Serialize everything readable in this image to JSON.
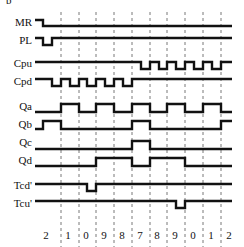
{
  "diagram": {
    "corner_mark": "b",
    "signals": [
      {
        "name": "MR",
        "label_y": 17
      },
      {
        "name": "PL",
        "label_y": 35
      },
      {
        "name": "Cpu",
        "label_y": 58
      },
      {
        "name": "Cpd",
        "label_y": 76
      },
      {
        "name": "Qa",
        "label_y": 101
      },
      {
        "name": "Qb",
        "label_y": 119
      },
      {
        "name": "Qc",
        "label_y": 137
      },
      {
        "name": "Qd",
        "label_y": 155
      },
      {
        "name": "Tcd'",
        "label_y": 180
      },
      {
        "name": "Tcu'",
        "label_y": 198
      }
    ],
    "count_sequence": [
      "2",
      "1",
      "0",
      "9",
      "8",
      "7",
      "8",
      "9",
      "0",
      "1",
      "2"
    ],
    "count_label_x": [
      46,
      68,
      86,
      104,
      122,
      140,
      157,
      175,
      193,
      211,
      229
    ],
    "gridlines_x": [
      61,
      79,
      96,
      114,
      132,
      150,
      167,
      185,
      203,
      221
    ],
    "waveform_color": "#111111",
    "gridline_color": "#555555"
  },
  "chart_data": {
    "type": "timing-diagram",
    "title": "",
    "x_tick_labels": [
      "2",
      "1",
      "0",
      "9",
      "8",
      "7",
      "8",
      "9",
      "0",
      "1",
      "2"
    ],
    "grid": true,
    "signals": {
      "MR": {
        "points": [
          [
            35,
            20
          ],
          [
            43,
            20
          ],
          [
            43,
            26
          ],
          [
            232,
            26
          ]
        ]
      },
      "PL": {
        "points": [
          [
            35,
            38
          ],
          [
            43,
            38
          ],
          [
            43,
            45
          ],
          [
            52,
            45
          ],
          [
            52,
            38
          ],
          [
            232,
            38
          ]
        ]
      },
      "Cpu": {
        "points": [
          [
            35,
            62
          ],
          [
            141,
            62
          ],
          [
            141,
            69
          ],
          [
            150,
            69
          ],
          [
            150,
            62
          ],
          [
            159,
            62
          ],
          [
            159,
            69
          ],
          [
            167,
            69
          ],
          [
            167,
            62
          ],
          [
            176,
            62
          ],
          [
            176,
            69
          ],
          [
            185,
            69
          ],
          [
            185,
            62
          ],
          [
            194,
            62
          ],
          [
            194,
            69
          ],
          [
            203,
            69
          ],
          [
            203,
            62
          ],
          [
            212,
            62
          ],
          [
            212,
            69
          ],
          [
            221,
            69
          ],
          [
            221,
            62
          ],
          [
            232,
            62
          ]
        ]
      },
      "Cpd": {
        "points": [
          [
            35,
            79
          ],
          [
            52,
            79
          ],
          [
            52,
            86
          ],
          [
            61,
            86
          ],
          [
            61,
            79
          ],
          [
            70,
            79
          ],
          [
            70,
            86
          ],
          [
            79,
            86
          ],
          [
            79,
            79
          ],
          [
            87,
            79
          ],
          [
            87,
            86
          ],
          [
            96,
            86
          ],
          [
            96,
            79
          ],
          [
            105,
            79
          ],
          [
            105,
            86
          ],
          [
            114,
            86
          ],
          [
            114,
            79
          ],
          [
            123,
            79
          ],
          [
            123,
            86
          ],
          [
            132,
            86
          ],
          [
            132,
            79
          ],
          [
            232,
            79
          ]
        ]
      },
      "Qa": {
        "points": [
          [
            35,
            112
          ],
          [
            61,
            112
          ],
          [
            61,
            104
          ],
          [
            79,
            104
          ],
          [
            79,
            112
          ],
          [
            96,
            112
          ],
          [
            96,
            104
          ],
          [
            114,
            104
          ],
          [
            114,
            112
          ],
          [
            132,
            112
          ],
          [
            132,
            104
          ],
          [
            150,
            104
          ],
          [
            150,
            112
          ],
          [
            167,
            112
          ],
          [
            167,
            104
          ],
          [
            185,
            104
          ],
          [
            185,
            112
          ],
          [
            203,
            112
          ],
          [
            203,
            104
          ],
          [
            221,
            104
          ],
          [
            221,
            112
          ],
          [
            232,
            112
          ]
        ]
      },
      "Qb": {
        "points": [
          [
            35,
            129
          ],
          [
            43,
            129
          ],
          [
            43,
            121
          ],
          [
            61,
            121
          ],
          [
            61,
            129
          ],
          [
            132,
            129
          ],
          [
            132,
            121
          ],
          [
            150,
            121
          ],
          [
            150,
            129
          ],
          [
            221,
            129
          ],
          [
            221,
            121
          ],
          [
            232,
            121
          ]
        ]
      },
      "Qc": {
        "points": [
          [
            35,
            149
          ],
          [
            132,
            149
          ],
          [
            132,
            141
          ],
          [
            150,
            141
          ],
          [
            150,
            149
          ],
          [
            232,
            149
          ]
        ]
      },
      "Qd": {
        "points": [
          [
            35,
            166
          ],
          [
            96,
            166
          ],
          [
            96,
            158
          ],
          [
            132,
            158
          ],
          [
            132,
            166
          ],
          [
            150,
            166
          ],
          [
            150,
            158
          ],
          [
            185,
            158
          ],
          [
            185,
            166
          ],
          [
            232,
            166
          ]
        ]
      },
      "Tcd'": {
        "points": [
          [
            35,
            184
          ],
          [
            87,
            184
          ],
          [
            87,
            191
          ],
          [
            96,
            191
          ],
          [
            96,
            184
          ],
          [
            232,
            184
          ]
        ]
      },
      "Tcu'": {
        "points": [
          [
            35,
            201
          ],
          [
            176,
            201
          ],
          [
            176,
            208
          ],
          [
            185,
            208
          ],
          [
            185,
            201
          ],
          [
            232,
            201
          ]
        ]
      }
    }
  }
}
